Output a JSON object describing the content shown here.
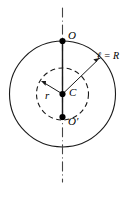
{
  "figure": {
    "kind": "geometry-diagram",
    "background_color": "#ffffff",
    "stroke_color": "#000000",
    "labels": {
      "top_point": "O",
      "bottom_point": "O′",
      "center_point": "C",
      "inner_radius": "r",
      "outer_radius": "ℓ = R"
    },
    "geometry": {
      "center": {
        "x": 62.5,
        "y": 94
      },
      "outer_circle": {
        "radius": 53,
        "style": "solid"
      },
      "inner_circle": {
        "radius": 26,
        "style": "dashed"
      },
      "axis": {
        "x": 62.5,
        "y_top": 8,
        "y_bottom": 182,
        "style": "dash-dot"
      },
      "chord_segment": {
        "from_y": 41,
        "to_y": 117,
        "style": "solid"
      },
      "outer_radius_arrow": {
        "from": {
          "x": 62.5,
          "y": 94
        },
        "to": {
          "x": 100,
          "y": 58
        }
      },
      "inner_radius_arrow": {
        "from": {
          "x": 62.5,
          "y": 94
        },
        "to": {
          "x": 41,
          "y": 81
        }
      },
      "points": [
        {
          "name": "O",
          "x": 62.5,
          "y": 41
        },
        {
          "name": "C",
          "x": 62.5,
          "y": 94
        },
        {
          "name": "O'",
          "x": 62.5,
          "y": 117
        }
      ]
    }
  }
}
